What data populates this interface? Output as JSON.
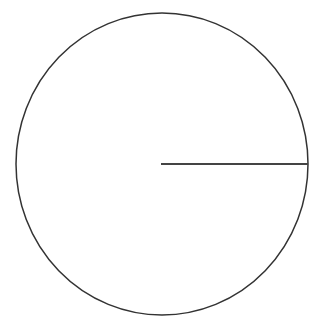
{
  "diagram": {
    "type": "circle-with-radius",
    "canvas": {
      "width": 319,
      "height": 327,
      "background": "#ffffff"
    },
    "circle": {
      "cx": 162,
      "cy": 164,
      "rx": 146,
      "ry": 151,
      "stroke": "#333333",
      "stroke_width": 1.5
    },
    "radius_line": {
      "x1": 161,
      "y1": 164,
      "x2": 308,
      "y2": 164,
      "stroke": "#444444",
      "stroke_width": 1.8
    }
  }
}
